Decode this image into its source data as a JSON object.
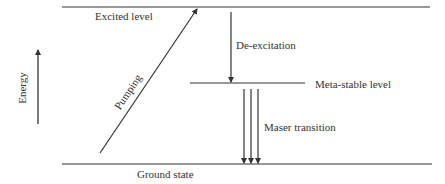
{
  "diagram": {
    "axis": {
      "label": "Energy",
      "direction": "up"
    },
    "levels": {
      "excited": "Excited level",
      "metastable": "Meta-stable level",
      "ground": "Ground state"
    },
    "transitions": {
      "pumping": "Pumping",
      "deexcitation": "De-excitation",
      "maser": "Maser transition"
    },
    "colors": {
      "line": "#333333",
      "background": "#ffffff"
    }
  }
}
